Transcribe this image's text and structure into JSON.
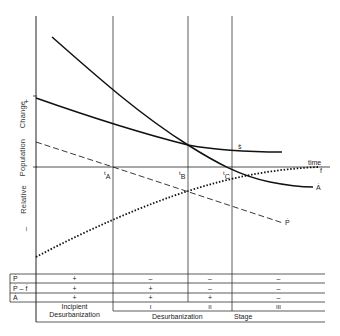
{
  "diagram": {
    "y_axis": {
      "label": "Relative Population Change",
      "label_words": [
        "Relative",
        "Population",
        "Change"
      ],
      "plus_marker": "+",
      "minus_marker": "–"
    },
    "x_axis": {
      "label": "time"
    },
    "time_markers": [
      {
        "label": "t",
        "sub": "A"
      },
      {
        "label": "t",
        "sub": "B"
      },
      {
        "label": "t",
        "sub": "C"
      }
    ],
    "curve_labels": {
      "s_dot": "ṡ",
      "a_dot": "Ȧ",
      "p_dot": "Ṗ",
      "f_dot": "ḟ"
    },
    "table": {
      "row_labels": [
        "Ṗ",
        "Ṗ – ḟ",
        "Ȧ"
      ],
      "columns": [
        {
          "values": [
            "+",
            "+",
            "+"
          ]
        },
        {
          "values": [
            "–",
            "+",
            "+"
          ]
        },
        {
          "values": [
            "–",
            "–",
            "+"
          ]
        },
        {
          "values": [
            "–",
            "–",
            "–"
          ]
        }
      ],
      "stage_numerals": [
        "I",
        "II",
        "III"
      ],
      "incipient_label_line1": "Incipient",
      "incipient_label_line2": "Desurbanization",
      "stage_label_left": "Desurbanization",
      "stage_label_right": "Stage"
    }
  }
}
